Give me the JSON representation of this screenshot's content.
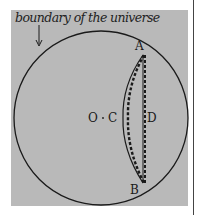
{
  "caption": "boundary of the universe",
  "labels": {
    "A": "A",
    "B": "B",
    "C": "C",
    "D": "D",
    "O": "O"
  },
  "colors": {
    "panel": "#b9b9b9",
    "ink": "#1a1a1a",
    "background": "#ffffff"
  }
}
